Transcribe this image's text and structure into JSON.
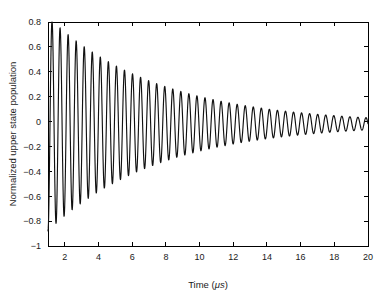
{
  "chart_data": {
    "type": "line",
    "title": "",
    "xlabel": "Time (μs)",
    "xlabel_text": "Time (",
    "xlabel_unit": "μs",
    "xlabel_close": ")",
    "ylabel": "Normalized upper state population",
    "xlim": [
      1,
      20
    ],
    "ylim": [
      -1,
      0.8
    ],
    "xticks": [
      2,
      4,
      6,
      8,
      10,
      12,
      14,
      16,
      18,
      20
    ],
    "xticklabels": [
      "2",
      "4",
      "6",
      "8",
      "10",
      "12",
      "14",
      "16",
      "18",
      "20"
    ],
    "yticks": [
      -1,
      -0.8,
      -0.6,
      -0.4,
      -0.2,
      0,
      0.2,
      0.4,
      0.6,
      0.8
    ],
    "yticklabels": [
      "−1",
      "−0.8",
      "−0.6",
      "−0.4",
      "−0.2",
      "0",
      "0.2",
      "0.4",
      "0.6",
      "0.8"
    ],
    "grid": false,
    "legend": null,
    "line_color": "#111111",
    "series": [
      {
        "name": "Normalized upper state population",
        "description": "Exponentially damped Rabi oscillation",
        "model": "y(t) = A0 * exp(-(t - t0)/tau) * cos(2*pi*(t - t0)/T + phi) + offset",
        "parameters": {
          "t_start": 1.0,
          "t_end": 20.0,
          "amplitude_initial": 0.86,
          "decay_time_tau": 6.6,
          "period": 0.478,
          "phase_deg": 180,
          "offset": -0.018,
          "samples": 1400
        },
        "peak_times": [
          1.24,
          1.72,
          2.2,
          2.68,
          3.15,
          3.63,
          4.11,
          4.59,
          5.07,
          5.55,
          6.02,
          6.5,
          6.98,
          7.46,
          7.94,
          8.42,
          8.89,
          9.37,
          9.85,
          10.33,
          10.81,
          11.29,
          11.76,
          12.24,
          12.72,
          13.2,
          13.68,
          14.16,
          14.63,
          15.11,
          15.59,
          16.07,
          16.55,
          17.03,
          17.5,
          17.98,
          18.46,
          18.94,
          19.42,
          19.9
        ],
        "peak_values": [
          0.72,
          0.645,
          0.55,
          0.485,
          0.425,
          0.37,
          0.325,
          0.29,
          0.26,
          0.23,
          0.205,
          0.183,
          0.163,
          0.147,
          0.131,
          0.118,
          0.106,
          0.095,
          0.086,
          0.077,
          0.069,
          0.063,
          0.057,
          0.051,
          0.046,
          0.042,
          0.038,
          0.034,
          0.031,
          0.028,
          0.026,
          0.023,
          0.021,
          0.019,
          0.018,
          0.016,
          0.015,
          0.014,
          0.013,
          0.012
        ],
        "trough_values": [
          -0.84,
          -0.69,
          -0.6,
          -0.52,
          -0.45,
          -0.395,
          -0.35,
          -0.31,
          -0.275,
          -0.245,
          -0.22,
          -0.198,
          -0.178,
          -0.161,
          -0.145,
          -0.131,
          -0.119,
          -0.108,
          -0.098,
          -0.089,
          -0.081,
          -0.074,
          -0.068,
          -0.062,
          -0.057,
          -0.052,
          -0.048,
          -0.044,
          -0.041,
          -0.038,
          -0.035,
          -0.033,
          -0.031,
          -0.029,
          -0.027,
          -0.025,
          -0.024,
          -0.023,
          -0.022,
          -0.021
        ],
        "start_value": -0.85,
        "end_value": -0.018
      }
    ]
  }
}
